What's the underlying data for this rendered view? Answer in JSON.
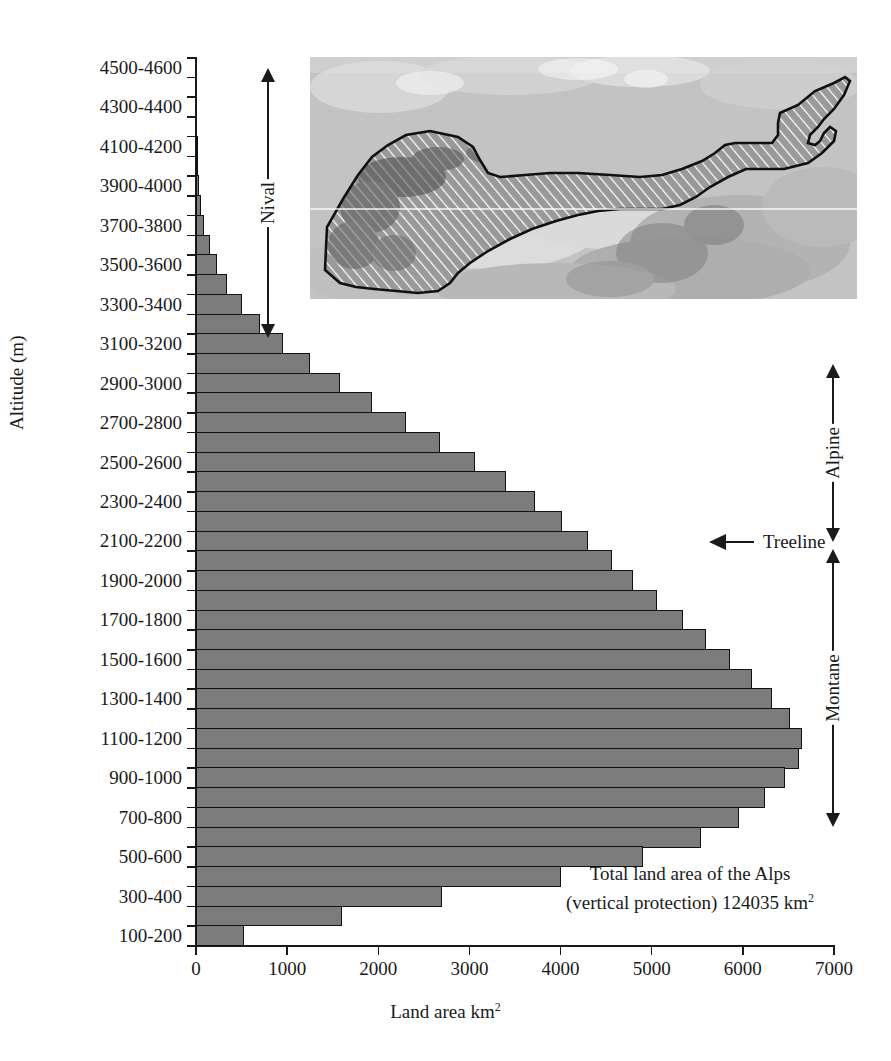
{
  "figure": {
    "title": "",
    "x_axis_title_main": "Land area km",
    "x_axis_title_sup": "2",
    "y_axis_title": "Altitude (m)"
  },
  "annotations": {
    "treeline_label": "Treeline",
    "total_note_line1": "Total land area of the Alps",
    "total_note_line2": "(vertical protection) 124035 km",
    "total_note_sup": "2",
    "zone_nival": "Nival",
    "zone_alpine": "Alpine",
    "zone_montane": "Montane"
  },
  "inset": {
    "caption": "",
    "alt": "satellite-map-of-the-alps-with-hatched-outline"
  },
  "chart_data": {
    "type": "bar",
    "orientation": "horizontal",
    "title": "",
    "xlabel": "Land area km2",
    "ylabel": "Altitude (m)",
    "xlim": [
      0,
      7000
    ],
    "ylim_categories": 45,
    "grid": false,
    "legend": null,
    "bar_color": "#7c7c7c",
    "bar_edge_color": "#111111",
    "x_ticks": [
      0,
      1000,
      2000,
      3000,
      4000,
      5000,
      6000,
      7000
    ],
    "x_tick_labels": [
      "0",
      "1000",
      "2000",
      "3000",
      "4000",
      "5000",
      "6000",
      "7000"
    ],
    "y_tick_labels": [
      "4500-4600",
      "4300-4400",
      "4100-4200",
      "3900-4000",
      "3700-3800",
      "3500-3600",
      "3300-3400",
      "3100-3200",
      "2900-3000",
      "2700-2800",
      "2500-2600",
      "2300-2400",
      "2100-2200",
      "1900-2000",
      "1700-1800",
      "1500-1600",
      "1300-1400",
      "1100-1200",
      "900-1000",
      "700-800",
      "500-600",
      "300-400",
      "100-200"
    ],
    "categories": [
      "4500-4600",
      "4400-4500",
      "4300-4400",
      "4200-4300",
      "4100-4200",
      "4000-4100",
      "3900-4000",
      "3800-3900",
      "3700-3800",
      "3600-3700",
      "3500-3600",
      "3400-3500",
      "3300-3400",
      "3200-3300",
      "3100-3200",
      "3000-3100",
      "2900-3000",
      "2800-2900",
      "2700-2800",
      "2600-2700",
      "2500-2600",
      "2400-2500",
      "2300-2400",
      "2200-2300",
      "2100-2200",
      "2000-2100",
      "1900-2000",
      "1800-1900",
      "1700-1800",
      "1600-1700",
      "1500-1600",
      "1400-1500",
      "1300-1400",
      "1200-1300",
      "1100-1200",
      "1000-1100",
      "900-1000",
      "800-900",
      "700-800",
      "600-700",
      "500-600",
      "400-500",
      "300-400",
      "200-300",
      "100-200"
    ],
    "values": [
      0,
      0,
      0,
      0,
      10,
      20,
      35,
      55,
      90,
      150,
      230,
      340,
      500,
      700,
      960,
      1250,
      1580,
      1930,
      2300,
      2680,
      3060,
      3400,
      3720,
      4020,
      4300,
      4560,
      4800,
      5060,
      5340,
      5600,
      5860,
      6100,
      6320,
      6520,
      6650,
      6620,
      6460,
      6240,
      5960,
      5540,
      4900,
      4000,
      2700,
      1600,
      530
    ],
    "zones": [
      {
        "name": "Nival",
        "from_category": "4500-4600",
        "to_category": "3000-3100"
      },
      {
        "name": "Alpine",
        "from_category": "2900-3000",
        "to_category": "2100-2200"
      },
      {
        "name": "Montane",
        "from_category": "2000-2100",
        "to_category": "100-200"
      }
    ],
    "markers": [
      {
        "label": "Treeline",
        "at_category": "2100-2200",
        "value": 5540
      }
    ]
  }
}
